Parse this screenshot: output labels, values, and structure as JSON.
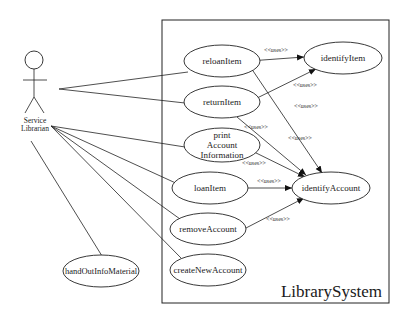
{
  "diagram": {
    "type": "uml-use-case",
    "system": {
      "label": "LibrarySystem"
    },
    "actor": {
      "label_line1": "Service",
      "label_line2": "Librarian"
    },
    "use_cases": {
      "reloanItem": "reloanItem",
      "returnItem": "returnItem",
      "printAccount_l1": "print",
      "printAccount_l2": "Account",
      "printAccount_l3": "Information",
      "loanItem": "loanItem",
      "removeAccount": "removeAccount",
      "createNewAccount": "createNewAccount",
      "identifyItem": "identifyItem",
      "identifyAccount": "identifyAccount",
      "handOutInfoMaterial": "handOutInfoMaterial"
    },
    "stereotype": "<<uses>>",
    "relations": {
      "r1": "<<uses>>",
      "r2": "<<uses>>",
      "r3": "<<uses>>",
      "r4": "<<uses>>",
      "r5": "<<uses>>",
      "r6": "<<uses>>",
      "r7": "<<uses>>",
      "r8": "<<uses>>"
    }
  }
}
